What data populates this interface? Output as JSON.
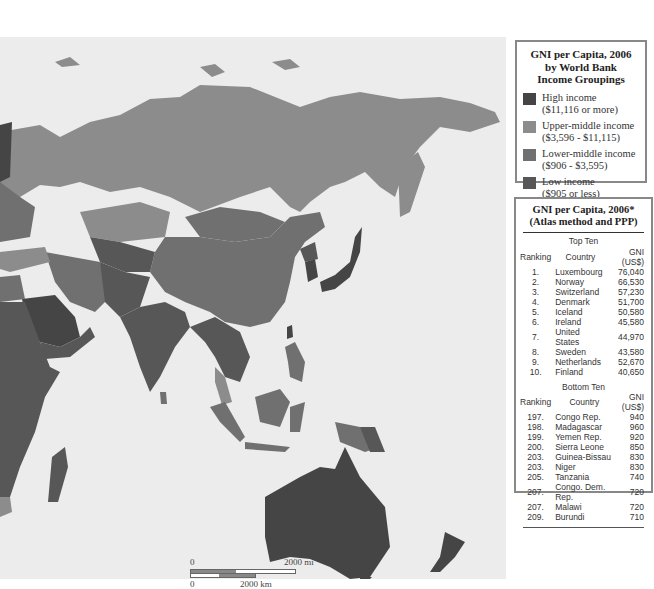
{
  "legend": {
    "title_line1": "GNI per Capita, 2006",
    "title_line2": "by World Bank",
    "title_line3": "Income Groupings",
    "items": [
      {
        "label": "High income",
        "range": "($11,116 or more)",
        "color": "#454545"
      },
      {
        "label": "Upper-middle income",
        "range": "($3,596 - $11,115)",
        "color": "#8c8c8c"
      },
      {
        "label": "Lower-middle income",
        "range": "($906 - $3,595)",
        "color": "#707070"
      },
      {
        "label": "Low income",
        "range": "($905 or less)",
        "color": "#575757"
      }
    ]
  },
  "ranking": {
    "title_line1": "GNI per Capita, 2006*",
    "title_line2": "(Atlas method and PPP)",
    "top": {
      "heading": "Top Ten",
      "columns": [
        "Ranking",
        "Country",
        "GNI (US$)"
      ],
      "rows": [
        {
          "rank": "1.",
          "country": "Luxembourg",
          "gni": "76,040"
        },
        {
          "rank": "2.",
          "country": "Norway",
          "gni": "66,530"
        },
        {
          "rank": "3.",
          "country": "Switzerland",
          "gni": "57,230"
        },
        {
          "rank": "4.",
          "country": "Denmark",
          "gni": "51,700"
        },
        {
          "rank": "5.",
          "country": "Iceland",
          "gni": "50,580"
        },
        {
          "rank": "6.",
          "country": "Ireland",
          "gni": "45,580"
        },
        {
          "rank": "7.",
          "country": "United States",
          "gni": "44,970"
        },
        {
          "rank": "8.",
          "country": "Sweden",
          "gni": "43,580"
        },
        {
          "rank": "9.",
          "country": "Netherlands",
          "gni": "52,670"
        },
        {
          "rank": "10.",
          "country": "Finland",
          "gni": "40,650"
        }
      ]
    },
    "bottom": {
      "heading": "Bottom Ten",
      "columns": [
        "Ranking",
        "Country",
        "GNI (US$)"
      ],
      "rows": [
        {
          "rank": "197.",
          "country": "Congo Rep.",
          "gni": "940"
        },
        {
          "rank": "198.",
          "country": "Madagascar",
          "gni": "960"
        },
        {
          "rank": "199.",
          "country": "Yemen Rep.",
          "gni": "920"
        },
        {
          "rank": "200.",
          "country": "Sierra Leone",
          "gni": "850"
        },
        {
          "rank": "203.",
          "country": "Guinea-Bissau",
          "gni": "830"
        },
        {
          "rank": "203.",
          "country": "Niger",
          "gni": "830"
        },
        {
          "rank": "205.",
          "country": "Tanzania",
          "gni": "740"
        },
        {
          "rank": "207.",
          "country": "Congo. Dem. Rep.",
          "gni": "720"
        },
        {
          "rank": "207.",
          "country": "Malawi",
          "gni": "720"
        },
        {
          "rank": "209.",
          "country": "Burundi",
          "gni": "710"
        }
      ]
    }
  },
  "scale": {
    "mi_zero": "0",
    "mi_label": "2000 mi",
    "km_zero": "0",
    "km_label": "2000 km"
  },
  "map": {
    "ocean_color": "#ececec",
    "colors": {
      "high": "#454545",
      "upper_middle": "#8c8c8c",
      "lower_middle": "#707070",
      "low": "#575757"
    }
  }
}
